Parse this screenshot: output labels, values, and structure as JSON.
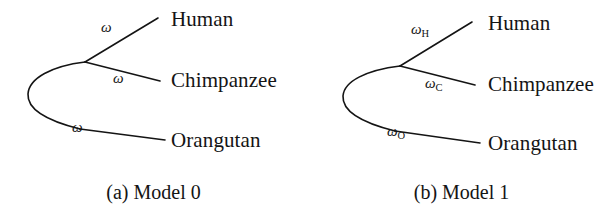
{
  "figure": {
    "background_color": "#ffffff",
    "stroke_color": "#141414",
    "text_color": "#141414"
  },
  "panels": [
    {
      "id": "model-0",
      "caption": "(a) Model 0",
      "taxa": [
        {
          "name": "human",
          "label": "Human"
        },
        {
          "name": "chimpanzee",
          "label": "Chimpanzee"
        },
        {
          "name": "orangutan",
          "label": "Orangutan"
        }
      ],
      "branch_labels": [
        {
          "name": "human-branch",
          "symbol": "ω",
          "subscript": ""
        },
        {
          "name": "chimpanzee-branch",
          "symbol": "ω",
          "subscript": ""
        },
        {
          "name": "orangutan-branch",
          "symbol": "ω",
          "subscript": ""
        }
      ]
    },
    {
      "id": "model-1",
      "caption": "(b) Model 1",
      "taxa": [
        {
          "name": "human",
          "label": "Human"
        },
        {
          "name": "chimpanzee",
          "label": "Chimpanzee"
        },
        {
          "name": "orangutan",
          "label": "Orangutan"
        }
      ],
      "branch_labels": [
        {
          "name": "human-branch",
          "symbol": "ω",
          "subscript": "H"
        },
        {
          "name": "chimpanzee-branch",
          "symbol": "ω",
          "subscript": "C"
        },
        {
          "name": "orangutan-branch",
          "symbol": "ω",
          "subscript": "O"
        }
      ]
    }
  ]
}
